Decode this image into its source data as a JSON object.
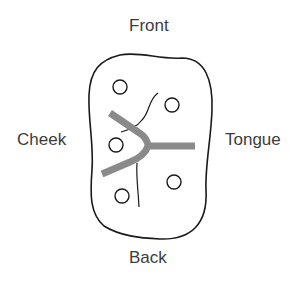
{
  "diagram": {
    "labels": {
      "front": "Front",
      "back": "Back",
      "cheek": "Cheek",
      "tongue": "Tongue"
    },
    "colors": {
      "outline": "#1a1a1a",
      "tooth_line": "#8a8a8a",
      "text": "#3c3c3c"
    },
    "circles_count": 5
  }
}
